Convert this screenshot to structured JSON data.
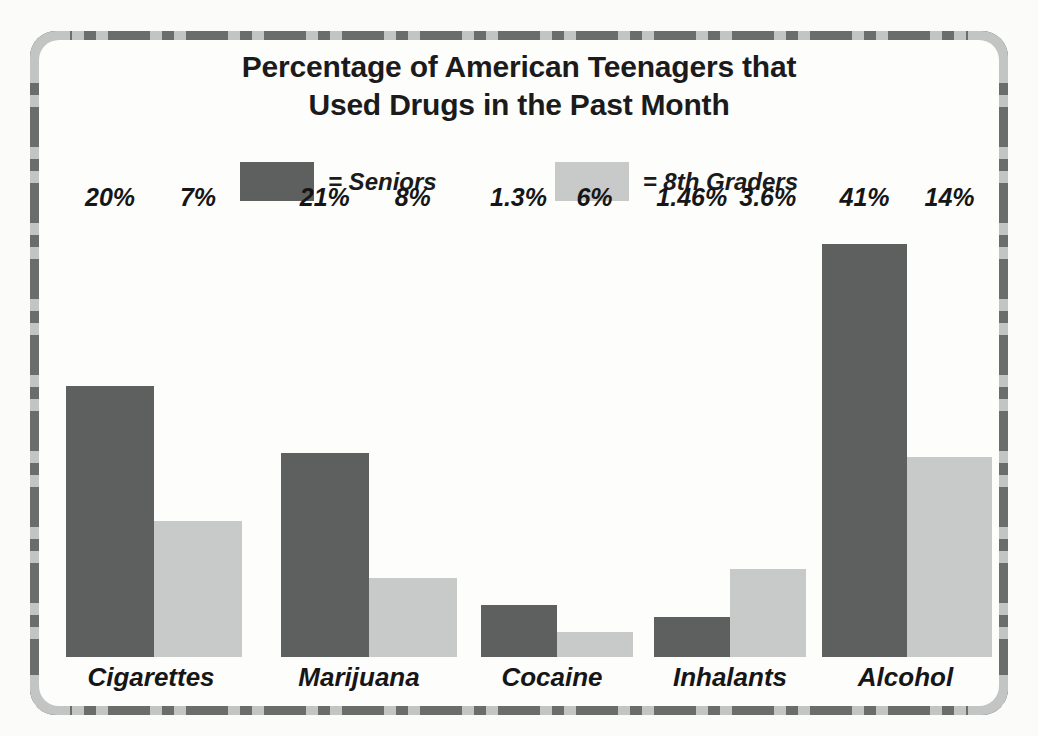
{
  "title": {
    "line1": "Percentage of American Teenagers that",
    "line2": "Used Drugs in the Past Month"
  },
  "legend": [
    {
      "label": "= Seniors",
      "color": "#5e5f5f",
      "swatch_name": "seniors"
    },
    {
      "label": "= 8th Graders",
      "color": "#c8c9c9",
      "swatch_name": "8th-graders"
    }
  ],
  "colors": {
    "seniors": "#5e5f5f",
    "eighth_graders": "#c8c9c9",
    "frame_light": "#c3c4c4",
    "frame_dark": "#6b6c6c",
    "text": "#161616",
    "background": "#fdfdfc"
  },
  "chart_data": {
    "type": "bar",
    "title": "Percentage of American Teenagers that Used Drugs in the Past Month",
    "xlabel": "",
    "ylabel": "",
    "grid": false,
    "legend_position": "top-center",
    "categories": [
      "Cigarettes",
      "Marijuana",
      "Cocaine",
      "Inhalants",
      "Alcohol"
    ],
    "series": [
      {
        "name": "Seniors",
        "color": "#5e5f5f",
        "values": [
          20,
          21,
          1.3,
          1.46,
          41
        ],
        "labels": [
          "20%",
          "21%",
          "1.3%",
          "1.46%",
          "41%"
        ],
        "bar_pixel_heights": [
          271,
          204,
          52,
          40,
          413
        ]
      },
      {
        "name": "8th Graders",
        "color": "#c8c9c9",
        "values": [
          7,
          8,
          6,
          3.6,
          14
        ],
        "labels": [
          "7%",
          "8%",
          "6%",
          "3.6%",
          "14%"
        ],
        "bar_pixel_heights": [
          136,
          79,
          25,
          88,
          200
        ]
      }
    ]
  }
}
